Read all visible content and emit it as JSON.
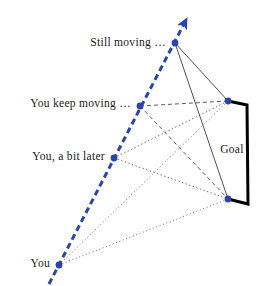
{
  "figure": {
    "type": "diagram",
    "title_cut_off": "ocular pursuit",
    "background": "#ffffff",
    "width": 270,
    "height": 286
  },
  "colors": {
    "trajectory_blue": "#2b44a8",
    "dot_blue": "#2b44a8",
    "goal_black": "#000000",
    "sightline_gray": "#555555",
    "text": "#1a1a1a"
  },
  "labels": {
    "still_moving": "Still moving …",
    "keep_moving": "You keep moving …",
    "bit_later": "You, a bit later",
    "you": "You",
    "goal": "Goal"
  },
  "trajectory": {
    "name": "observer-motion-path",
    "style": "dashed",
    "color": "#2b44a8",
    "start": [
      49,
      284
    ],
    "end": [
      188,
      17
    ],
    "arrowhead": "at-end",
    "width": 3
  },
  "observer_positions": [
    {
      "name": "you",
      "label": "You",
      "x": 59,
      "y": 265,
      "sightline_style": "dotted"
    },
    {
      "name": "you-a-bit-later",
      "label": "You, a bit later",
      "x": 114,
      "y": 158,
      "sightline_style": "dashed-fine"
    },
    {
      "name": "you-keep-moving",
      "label": "You keep moving …",
      "x": 140,
      "y": 106,
      "sightline_style": "dashed"
    },
    {
      "name": "still-moving",
      "label": "Still moving …",
      "x": 175,
      "y": 43,
      "sightline_style": "solid-thin"
    }
  ],
  "goal": {
    "name": "goal-bracket",
    "label": "Goal",
    "top_dot": [
      228,
      101
    ],
    "bottom_dot": [
      228,
      199
    ],
    "top_corner": [
      247,
      105
    ],
    "bottom_corner": [
      248,
      204
    ],
    "stroke_width": 3,
    "label_position": [
      232,
      150
    ]
  },
  "label_anchors": {
    "still_moving": [
      166,
      43
    ],
    "keep_moving": [
      131,
      104
    ],
    "bit_later": [
      105,
      157
    ],
    "you": [
      50,
      264
    ]
  }
}
